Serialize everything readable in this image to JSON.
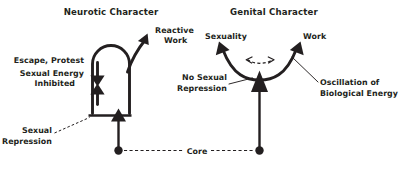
{
  "diagram": {
    "type": "conceptual-diagram",
    "background_color": "#ffffff",
    "ink_color": "#231f20",
    "panels": [
      {
        "id": "neurotic",
        "title": "Neurotic Character",
        "labels": {
          "reactive_work": "Reactive\nWork",
          "reactive_work_line1": "Reactive",
          "reactive_work_line2": "Work",
          "escape_protest": "Escape, Protest",
          "sexual_energy": "Sexual Energy",
          "inhibited": "Inhibited",
          "sexual_repression_line1": "Sexual",
          "sexual_repression_line2": "Repression"
        }
      },
      {
        "id": "genital",
        "title": "Genital Character",
        "labels": {
          "sexuality": "Sexuality",
          "work": "Work",
          "no_sexual_line1": "No Sexual",
          "no_sexual_line2": "Repression",
          "oscillation_line1": "Oscillation of",
          "oscillation_line2": "Biological Energy"
        }
      }
    ],
    "shared": {
      "core": "Core"
    }
  }
}
